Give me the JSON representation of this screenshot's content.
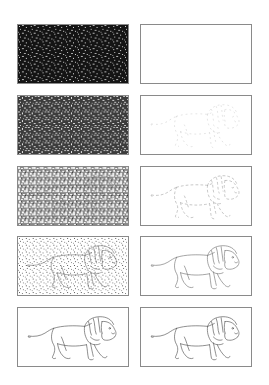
{
  "figure": {
    "columns": [
      {
        "id": "noisy",
        "label": "Noisy input"
      },
      {
        "id": "predicted",
        "label": "Predicted sketch"
      }
    ],
    "rows": [
      {
        "step": 1,
        "noise_density": 0.92,
        "noisy_background": "#151515",
        "prediction_visibility": 0.0
      },
      {
        "step": 2,
        "noise_density": 0.7,
        "noisy_background": "#3a3a3a",
        "prediction_visibility": 0.25
      },
      {
        "step": 3,
        "noise_density": 0.48,
        "noisy_background": "#7a7a7a",
        "prediction_visibility": 0.45
      },
      {
        "step": 4,
        "noise_density": 0.22,
        "noisy_background": "#dcdcdc",
        "prediction_visibility": 0.8
      },
      {
        "step": 5,
        "noise_density": 0.0,
        "noisy_background": "#ffffff",
        "prediction_visibility": 1.0
      }
    ],
    "colors": {
      "border": "#8a8a8a",
      "stroke": "#555555",
      "background": "#ffffff"
    }
  }
}
